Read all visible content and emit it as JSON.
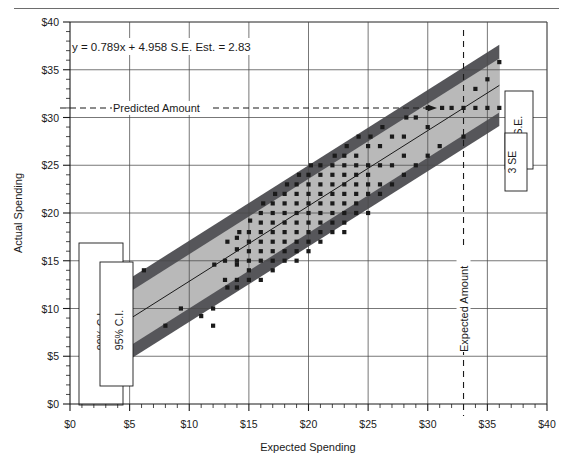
{
  "figure": {
    "name": "regression-scatter-confidence-bands",
    "has_top_rule": true
  },
  "chart_data": {
    "type": "scatter",
    "title": "",
    "xlabel": "Expected Spending",
    "ylabel": "Actual Spending",
    "xlim": [
      0,
      40
    ],
    "ylim": [
      0,
      40
    ],
    "xticks": [
      "$0",
      "$5",
      "$10",
      "$15",
      "$20",
      "$25",
      "$30",
      "$35",
      "$40"
    ],
    "xtick_values": [
      0,
      5,
      10,
      15,
      20,
      25,
      30,
      35,
      40
    ],
    "yticks": [
      "$0",
      "$5",
      "$10",
      "$15",
      "$20",
      "$25",
      "$30",
      "$35",
      "$40"
    ],
    "ytick_values": [
      0,
      5,
      10,
      15,
      20,
      25,
      30,
      35,
      40
    ],
    "minor_ticks_per_major": 5,
    "grid": true,
    "legend_position": "inside-left-and-right",
    "equation": "y = 0.789x + 4.958 S.E. Est. = 2.83",
    "regression": {
      "slope": 0.789,
      "intercept": 4.958,
      "se_estimate": 2.83,
      "x_start": 5,
      "x_end": 36
    },
    "bands": [
      {
        "name": "95% C.I. / 2 S.E.",
        "offset": 2.83,
        "color": "#b9b9b9",
        "label_left": "95% C.I.",
        "label_right": "2 S.E."
      },
      {
        "name": "99% C.I. / 3 SE",
        "offset": 4.25,
        "color": "#56565a",
        "label_left": "99% C.I.",
        "label_right": "3 SE"
      }
    ],
    "annotations": [
      {
        "name": "predicted-amount",
        "text": "Predicted Amount",
        "type": "horizontal-dashed",
        "y": 31.0,
        "orientation": "horizontal"
      },
      {
        "name": "expected-amount",
        "text": "Expected Amount",
        "type": "vertical-dashed",
        "x": 33.0,
        "orientation": "vertical"
      }
    ],
    "series": [
      {
        "name": "observations",
        "marker": "square",
        "color": "#1a1a1a",
        "points": [
          [
            5.0,
            8.2
          ],
          [
            5.0,
            9.6
          ],
          [
            6.2,
            14.0
          ],
          [
            8.0,
            8.2
          ],
          [
            9.3,
            10.0
          ],
          [
            11.0,
            9.2
          ],
          [
            12.0,
            10.0
          ],
          [
            12.0,
            8.2
          ],
          [
            12.1,
            14.6
          ],
          [
            13.0,
            13.0
          ],
          [
            13.2,
            12.2
          ],
          [
            13.0,
            15.0
          ],
          [
            13.2,
            17.0
          ],
          [
            14.0,
            12.2
          ],
          [
            14.0,
            13.0
          ],
          [
            14.0,
            14.6
          ],
          [
            14.0,
            15.0
          ],
          [
            14.0,
            16.2
          ],
          [
            14.0,
            17.4
          ],
          [
            14.2,
            18.0
          ],
          [
            15.0,
            13.0
          ],
          [
            15.0,
            14.0
          ],
          [
            15.0,
            15.0
          ],
          [
            15.0,
            16.0
          ],
          [
            15.0,
            17.0
          ],
          [
            15.0,
            18.0
          ],
          [
            15.1,
            19.2
          ],
          [
            16.0,
            13.0
          ],
          [
            16.0,
            15.0
          ],
          [
            16.0,
            16.0
          ],
          [
            16.0,
            17.0
          ],
          [
            16.0,
            18.0
          ],
          [
            16.0,
            19.0
          ],
          [
            16.0,
            20.0
          ],
          [
            16.2,
            21.0
          ],
          [
            17.0,
            14.0
          ],
          [
            17.0,
            15.0
          ],
          [
            17.0,
            16.0
          ],
          [
            17.0,
            17.0
          ],
          [
            17.0,
            18.0
          ],
          [
            17.0,
            19.0
          ],
          [
            17.0,
            20.0
          ],
          [
            17.0,
            21.0
          ],
          [
            17.2,
            22.0
          ],
          [
            18.0,
            15.0
          ],
          [
            18.0,
            16.0
          ],
          [
            18.0,
            17.0
          ],
          [
            18.0,
            18.0
          ],
          [
            18.0,
            19.0
          ],
          [
            18.0,
            20.0
          ],
          [
            18.0,
            21.0
          ],
          [
            18.0,
            22.0
          ],
          [
            18.2,
            23.0
          ],
          [
            19.0,
            15.0
          ],
          [
            19.0,
            16.0
          ],
          [
            19.0,
            17.0
          ],
          [
            19.0,
            18.0
          ],
          [
            19.0,
            19.0
          ],
          [
            19.0,
            20.0
          ],
          [
            19.0,
            21.0
          ],
          [
            19.0,
            22.0
          ],
          [
            19.0,
            23.0
          ],
          [
            19.2,
            24.0
          ],
          [
            20.0,
            16.0
          ],
          [
            20.0,
            17.0
          ],
          [
            20.0,
            18.0
          ],
          [
            20.0,
            19.0
          ],
          [
            20.0,
            20.0
          ],
          [
            20.0,
            21.0
          ],
          [
            20.0,
            22.0
          ],
          [
            20.0,
            23.0
          ],
          [
            20.0,
            24.0
          ],
          [
            20.2,
            25.0
          ],
          [
            21.0,
            17.0
          ],
          [
            21.0,
            18.0
          ],
          [
            21.0,
            19.0
          ],
          [
            21.0,
            20.0
          ],
          [
            21.0,
            21.0
          ],
          [
            21.0,
            22.0
          ],
          [
            21.0,
            23.0
          ],
          [
            21.0,
            24.0
          ],
          [
            21.0,
            25.0
          ],
          [
            22.0,
            18.0
          ],
          [
            22.0,
            19.0
          ],
          [
            22.0,
            20.0
          ],
          [
            22.0,
            21.0
          ],
          [
            22.0,
            22.0
          ],
          [
            22.0,
            23.0
          ],
          [
            22.0,
            24.0
          ],
          [
            22.0,
            25.0
          ],
          [
            22.2,
            26.0
          ],
          [
            23.0,
            18.0
          ],
          [
            23.0,
            19.0
          ],
          [
            23.0,
            20.0
          ],
          [
            23.0,
            21.0
          ],
          [
            23.0,
            22.0
          ],
          [
            23.0,
            23.0
          ],
          [
            23.0,
            24.0
          ],
          [
            23.0,
            25.0
          ],
          [
            23.0,
            26.0
          ],
          [
            23.2,
            27.0
          ],
          [
            24.0,
            20.0
          ],
          [
            24.0,
            21.0
          ],
          [
            24.0,
            22.0
          ],
          [
            24.0,
            23.0
          ],
          [
            24.0,
            24.0
          ],
          [
            24.0,
            25.0
          ],
          [
            24.0,
            26.0
          ],
          [
            24.2,
            28.0
          ],
          [
            25.0,
            20.0
          ],
          [
            25.0,
            22.0
          ],
          [
            25.0,
            23.0
          ],
          [
            25.0,
            24.0
          ],
          [
            25.0,
            25.0
          ],
          [
            25.0,
            27.0
          ],
          [
            25.2,
            28.0
          ],
          [
            26.0,
            22.0
          ],
          [
            26.0,
            23.0
          ],
          [
            26.0,
            25.0
          ],
          [
            26.0,
            27.0
          ],
          [
            26.2,
            29.0
          ],
          [
            27.0,
            23.0
          ],
          [
            27.0,
            25.0
          ],
          [
            27.0,
            28.0
          ],
          [
            28.0,
            24.0
          ],
          [
            28.0,
            26.0
          ],
          [
            28.0,
            28.0
          ],
          [
            28.2,
            30.0
          ],
          [
            29.0,
            25.0
          ],
          [
            29.0,
            30.0
          ],
          [
            30.0,
            26.0
          ],
          [
            30.0,
            29.0
          ],
          [
            30.0,
            31.0
          ],
          [
            31.0,
            27.0
          ],
          [
            31.2,
            31.0
          ],
          [
            32.0,
            31.0
          ],
          [
            33.0,
            28.0
          ],
          [
            33.0,
            31.0
          ],
          [
            34.0,
            31.0
          ],
          [
            34.0,
            33.0
          ],
          [
            35.0,
            31.0
          ],
          [
            35.0,
            34.0
          ],
          [
            36.0,
            31.0
          ],
          [
            36.0,
            35.8
          ]
        ]
      }
    ]
  },
  "axes": {
    "x_title": "Expected Spending",
    "y_title": "Actual Spending"
  },
  "labels": {
    "equation": "y = 0.789x + 4.958 S.E. Est. = 2.83",
    "predicted_amount": "Predicted Amount",
    "expected_amount": "Expected Amount",
    "ci_99": "99% C.I.",
    "ci_95": "95% C.I.",
    "se_2": "2 S.E.",
    "se_3": "3 SE"
  }
}
